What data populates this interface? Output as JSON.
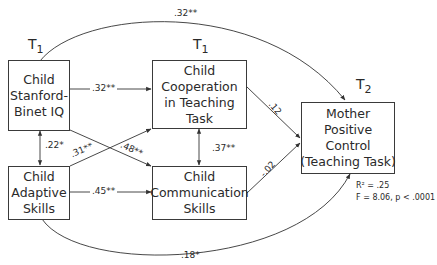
{
  "diagram": {
    "type": "path-model",
    "time_labels": {
      "left": {
        "base": "T",
        "sub": "1"
      },
      "middle": {
        "base": "T",
        "sub": "1"
      },
      "right": {
        "base": "T",
        "sub": "2"
      }
    },
    "nodes": [
      {
        "id": "iq",
        "lines": [
          "Child",
          "Stanford-",
          "Binet IQ"
        ]
      },
      {
        "id": "adaptive",
        "lines": [
          "Child",
          "Adaptive",
          "Skills"
        ]
      },
      {
        "id": "cooperation",
        "lines": [
          "Child",
          "Cooperation",
          "in Teaching",
          "Task"
        ]
      },
      {
        "id": "communication",
        "lines": [
          "Child",
          "Communication",
          "Skills"
        ]
      },
      {
        "id": "mother",
        "lines": [
          "Mother",
          "Positive",
          "Control",
          "(Teaching Task)"
        ]
      }
    ],
    "edges": [
      {
        "from": "iq",
        "to": "mother",
        "label": ".32**",
        "style": "curved-top"
      },
      {
        "from": "iq",
        "to": "cooperation",
        "label": ".32**"
      },
      {
        "from": "iq",
        "to": "communication",
        "label": ".48**"
      },
      {
        "from": "adaptive",
        "to": "cooperation",
        "label": ".31**"
      },
      {
        "from": "adaptive",
        "to": "communication",
        "label": ".45**"
      },
      {
        "from": "iq",
        "to": "adaptive",
        "label": ".22*",
        "style": "bidirectional"
      },
      {
        "from": "cooperation",
        "to": "communication",
        "label": ".37**",
        "style": "bidirectional"
      },
      {
        "from": "cooperation",
        "to": "mother",
        "label": ".12"
      },
      {
        "from": "communication",
        "to": "mother",
        "label": "-.02"
      },
      {
        "from": "adaptive",
        "to": "mother",
        "label": ".18*",
        "style": "curved-bottom"
      }
    ],
    "stats": {
      "r2": "R² = .25",
      "f": "F = 8.06, p < .0001"
    }
  }
}
